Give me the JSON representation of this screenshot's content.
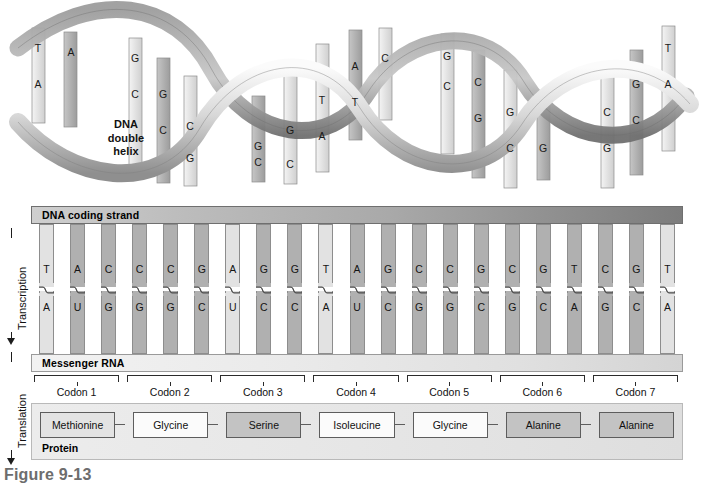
{
  "figure": {
    "caption": "Figure 9-13",
    "helix_caption": "DNA\ndouble\nhelix"
  },
  "axes": [
    {
      "name": "transcription",
      "label": "Transcription"
    },
    {
      "name": "translation",
      "label": "Translation"
    }
  ],
  "banners": {
    "dna_coding_strand": "DNA coding strand",
    "messenger_rna": "Messenger RNA",
    "protein": "Protein"
  },
  "helix": {
    "bases": [
      {
        "letter": "T",
        "x": 38,
        "y": 42,
        "shade": "light"
      },
      {
        "letter": "A",
        "x": 38,
        "y": 78,
        "shade": "mid"
      },
      {
        "letter": "A",
        "x": 71,
        "y": 46,
        "shade": "mid"
      },
      {
        "letter": "G",
        "x": 135,
        "y": 52,
        "shade": "light"
      },
      {
        "letter": "C",
        "x": 135,
        "y": 88,
        "shade": "light"
      },
      {
        "letter": "G",
        "x": 163,
        "y": 88,
        "shade": "mid"
      },
      {
        "letter": "C",
        "x": 163,
        "y": 124,
        "shade": "mid"
      },
      {
        "letter": "C",
        "x": 190,
        "y": 120,
        "shade": "light"
      },
      {
        "letter": "G",
        "x": 190,
        "y": 152,
        "shade": "light"
      },
      {
        "letter": "G",
        "x": 258,
        "y": 140,
        "shade": "mid"
      },
      {
        "letter": "C",
        "x": 258,
        "y": 156,
        "shade": "mid"
      },
      {
        "letter": "G",
        "x": 290,
        "y": 124,
        "shade": "light"
      },
      {
        "letter": "C",
        "x": 290,
        "y": 158,
        "shade": "light"
      },
      {
        "letter": "T",
        "x": 322,
        "y": 94,
        "shade": "light"
      },
      {
        "letter": "A",
        "x": 322,
        "y": 130,
        "shade": "light"
      },
      {
        "letter": "A",
        "x": 355,
        "y": 60,
        "shade": "mid"
      },
      {
        "letter": "T",
        "x": 355,
        "y": 96,
        "shade": "mid"
      },
      {
        "letter": "C",
        "x": 385,
        "y": 52,
        "shade": "light"
      },
      {
        "letter": "G",
        "x": 447,
        "y": 50,
        "shade": "light"
      },
      {
        "letter": "C",
        "x": 447,
        "y": 80,
        "shade": "light"
      },
      {
        "letter": "C",
        "x": 478,
        "y": 76,
        "shade": "mid"
      },
      {
        "letter": "G",
        "x": 478,
        "y": 112,
        "shade": "mid"
      },
      {
        "letter": "G",
        "x": 510,
        "y": 106,
        "shade": "light"
      },
      {
        "letter": "C",
        "x": 510,
        "y": 142,
        "shade": "light"
      },
      {
        "letter": "G",
        "x": 543,
        "y": 142,
        "shade": "mid"
      },
      {
        "letter": "C",
        "x": 607,
        "y": 106,
        "shade": "light"
      },
      {
        "letter": "G",
        "x": 607,
        "y": 142,
        "shade": "light"
      },
      {
        "letter": "G",
        "x": 636,
        "y": 78,
        "shade": "mid"
      },
      {
        "letter": "C",
        "x": 636,
        "y": 114,
        "shade": "mid"
      },
      {
        "letter": "T",
        "x": 668,
        "y": 42,
        "shade": "light"
      },
      {
        "letter": "A",
        "x": 668,
        "y": 78,
        "shade": "light"
      }
    ]
  },
  "sequence": {
    "dna_coding_strand": [
      "T",
      "A",
      "C",
      "C",
      "C",
      "G",
      "A",
      "G",
      "G",
      "T",
      "A",
      "G",
      "C",
      "C",
      "G",
      "C",
      "G",
      "T",
      "C",
      "G",
      "T"
    ],
    "messenger_rna": [
      "A",
      "U",
      "G",
      "G",
      "G",
      "C",
      "U",
      "C",
      "C",
      "A",
      "U",
      "C",
      "G",
      "G",
      "C",
      "G",
      "C",
      "A",
      "G",
      "C",
      "A"
    ],
    "shades": [
      "light",
      "mid",
      "mid",
      "mid",
      "mid",
      "mid",
      "light",
      "mid",
      "mid",
      "light",
      "mid",
      "mid",
      "mid",
      "mid",
      "mid",
      "mid",
      "mid",
      "mid",
      "mid",
      "mid",
      "light"
    ]
  },
  "codons": [
    {
      "label": "Codon 1"
    },
    {
      "label": "Codon 2"
    },
    {
      "label": "Codon 3"
    },
    {
      "label": "Codon 4"
    },
    {
      "label": "Codon 5"
    },
    {
      "label": "Codon 6"
    },
    {
      "label": "Codon 7"
    }
  ],
  "amino_acids": [
    {
      "name": "Methionine",
      "fill": "light"
    },
    {
      "name": "Glycine",
      "fill": "white"
    },
    {
      "name": "Serine",
      "fill": "dark"
    },
    {
      "name": "Isoleucine",
      "fill": "white"
    },
    {
      "name": "Glycine",
      "fill": "white"
    },
    {
      "name": "Alanine",
      "fill": "dark"
    },
    {
      "name": "Alanine",
      "fill": "dark"
    }
  ],
  "colors": {
    "base_light": "#e2e2e2",
    "base_mid": "#b0b0b0",
    "box_light": "#e3e3e3",
    "box_dark": "#c3c3c3",
    "box_white": "#fbfbfb",
    "outline": "#5d5d5d",
    "caption_gray": "#6d6d6d"
  }
}
